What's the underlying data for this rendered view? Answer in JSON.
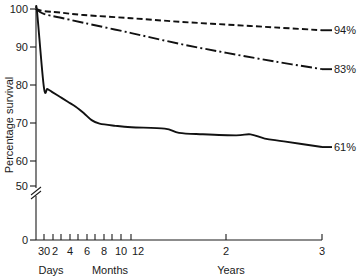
{
  "chart_data": {
    "type": "line",
    "title": "",
    "subtitle": "",
    "xlabel": "",
    "ylabel": "Percentage survival",
    "ylim": [
      0,
      100
    ],
    "grid": false,
    "legend_position": "right-endpoint-labels",
    "axis_break": {
      "present": true,
      "between": [
        0,
        50
      ],
      "symbol": "double-slash"
    },
    "y_ticks": [
      {
        "value": 100,
        "label": "100"
      },
      {
        "value": 90,
        "label": "90"
      },
      {
        "value": 80,
        "label": "80"
      },
      {
        "value": 70,
        "label": "70"
      },
      {
        "value": 60,
        "label": "60"
      },
      {
        "value": 50,
        "label": "50"
      },
      {
        "value": 0,
        "label": "0"
      }
    ],
    "x_axis": {
      "unit_groups": [
        {
          "caption": "Days",
          "ticks": [
            {
              "label": "30",
              "time_years": 0.0822
            }
          ]
        },
        {
          "caption": "Months",
          "ticks": [
            {
              "label": "2",
              "time_years": 0.1667
            },
            {
              "label": "",
              "time_years": 0.25
            },
            {
              "label": "4",
              "time_years": 0.3333
            },
            {
              "label": "",
              "time_years": 0.4167
            },
            {
              "label": "6",
              "time_years": 0.5
            },
            {
              "label": "",
              "time_years": 0.5833
            },
            {
              "label": "8",
              "time_years": 0.6667
            },
            {
              "label": "",
              "time_years": 0.75
            },
            {
              "label": "10",
              "time_years": 0.8333
            },
            {
              "label": "",
              "time_years": 0.9167
            },
            {
              "label": "12",
              "time_years": 1.0
            }
          ]
        },
        {
          "caption": "Years",
          "ticks": [
            {
              "label": "2",
              "time_years": 2.0
            },
            {
              "label": "3",
              "time_years": 3.0
            }
          ]
        }
      ]
    },
    "series": [
      {
        "name": "upper-curve",
        "style": "dashed",
        "endpoint_label": "94%",
        "final_value": 94,
        "points": [
          {
            "x": 0.0,
            "y": 100.0
          },
          {
            "x": 0.0822,
            "y": 99.4
          },
          {
            "x": 0.25,
            "y": 99.0
          },
          {
            "x": 0.5,
            "y": 98.3
          },
          {
            "x": 1.0,
            "y": 97.4
          },
          {
            "x": 1.5,
            "y": 96.4
          },
          {
            "x": 2.0,
            "y": 95.6
          },
          {
            "x": 2.5,
            "y": 94.8
          },
          {
            "x": 3.0,
            "y": 94.0
          }
        ]
      },
      {
        "name": "middle-curve",
        "style": "dash-dot",
        "endpoint_label": "83%",
        "final_value": 83,
        "points": [
          {
            "x": 0.0,
            "y": 100.0
          },
          {
            "x": 0.0822,
            "y": 98.6
          },
          {
            "x": 0.25,
            "y": 97.6
          },
          {
            "x": 0.5,
            "y": 96.1
          },
          {
            "x": 1.0,
            "y": 93.2
          },
          {
            "x": 1.5,
            "y": 90.2
          },
          {
            "x": 2.0,
            "y": 87.6
          },
          {
            "x": 2.5,
            "y": 85.2
          },
          {
            "x": 3.0,
            "y": 83.0
          }
        ]
      },
      {
        "name": "lower-curve",
        "style": "solid",
        "endpoint_label": "61%",
        "final_value": 61,
        "points": [
          {
            "x": 0.0,
            "y": 100.0
          },
          {
            "x": 0.012,
            "y": 99.0
          },
          {
            "x": 0.0822,
            "y": 78.0
          },
          {
            "x": 0.12,
            "y": 77.4
          },
          {
            "x": 0.1667,
            "y": 76.6
          },
          {
            "x": 0.25,
            "y": 75.2
          },
          {
            "x": 0.3333,
            "y": 73.8
          },
          {
            "x": 0.4167,
            "y": 72.4
          },
          {
            "x": 0.5,
            "y": 70.6
          },
          {
            "x": 0.5833,
            "y": 68.6
          },
          {
            "x": 0.6667,
            "y": 67.6
          },
          {
            "x": 0.8333,
            "y": 67.0
          },
          {
            "x": 1.0,
            "y": 66.6
          },
          {
            "x": 1.35,
            "y": 66.2
          },
          {
            "x": 1.5,
            "y": 65.0
          },
          {
            "x": 1.75,
            "y": 64.6
          },
          {
            "x": 2.1,
            "y": 64.3
          },
          {
            "x": 2.25,
            "y": 64.6
          },
          {
            "x": 2.4,
            "y": 63.4
          },
          {
            "x": 2.6,
            "y": 62.6
          },
          {
            "x": 3.0,
            "y": 61.0
          }
        ]
      }
    ]
  }
}
